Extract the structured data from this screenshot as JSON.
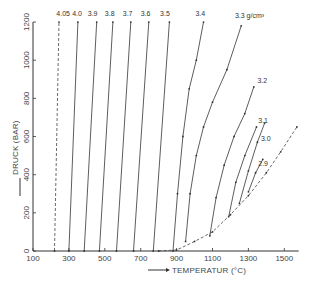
{
  "chart_data": {
    "type": "line",
    "title": "",
    "xlabel": "TEMPERATUR (°C)",
    "ylabel": "DRUCK (BAR)",
    "xlim": [
      100,
      1600
    ],
    "ylim": [
      0,
      1200
    ],
    "x_ticks": [
      100,
      300,
      500,
      700,
      900,
      1100,
      1300,
      1500
    ],
    "y_ticks": [
      0,
      200,
      400,
      600,
      800,
      1000,
      1200
    ],
    "grid": false,
    "legend": "inline labels at curve ends",
    "series": [
      {
        "name": "4.05",
        "style": "dashed",
        "points": [
          [
            220,
            0
          ],
          [
            245,
            1200
          ]
        ]
      },
      {
        "name": "4.0",
        "style": "solid",
        "points": [
          [
            300,
            0
          ],
          [
            350,
            1200
          ]
        ]
      },
      {
        "name": "3.9",
        "style": "solid",
        "points": [
          [
            385,
            0
          ],
          [
            455,
            1200
          ]
        ]
      },
      {
        "name": "3.8",
        "style": "solid",
        "points": [
          [
            470,
            0
          ],
          [
            545,
            1200
          ]
        ]
      },
      {
        "name": "3.7",
        "style": "solid",
        "points": [
          [
            565,
            0
          ],
          [
            645,
            1200
          ]
        ]
      },
      {
        "name": "3.6",
        "style": "solid",
        "points": [
          [
            660,
            0
          ],
          [
            745,
            1200
          ]
        ]
      },
      {
        "name": "3.5",
        "style": "solid",
        "points": [
          [
            770,
            0
          ],
          [
            860,
            1200
          ]
        ]
      },
      {
        "name": "3.4",
        "style": "solid",
        "points": [
          [
            880,
            0
          ],
          [
            905,
            300
          ],
          [
            935,
            600
          ],
          [
            970,
            850
          ],
          [
            1010,
            1000
          ],
          [
            1050,
            1200
          ]
        ]
      },
      {
        "name": "3.3 g/cm³",
        "style": "solid",
        "points": [
          [
            950,
            50
          ],
          [
            975,
            300
          ],
          [
            1010,
            500
          ],
          [
            1050,
            650
          ],
          [
            1100,
            780
          ],
          [
            1180,
            950
          ],
          [
            1260,
            1180
          ]
        ]
      },
      {
        "name": "3.2",
        "style": "solid",
        "points": [
          [
            1085,
            80
          ],
          [
            1120,
            280
          ],
          [
            1165,
            450
          ],
          [
            1220,
            600
          ],
          [
            1280,
            720
          ],
          [
            1330,
            860
          ]
        ]
      },
      {
        "name": "3.1",
        "style": "solid",
        "points": [
          [
            1190,
            180
          ],
          [
            1230,
            360
          ],
          [
            1280,
            500
          ],
          [
            1345,
            650
          ]
        ]
      },
      {
        "name": "3.0",
        "style": "solid",
        "points": [
          [
            1250,
            250
          ],
          [
            1300,
            420
          ],
          [
            1350,
            570
          ],
          [
            1390,
            670
          ]
        ]
      },
      {
        "name": "2.9",
        "style": "solid",
        "points": [
          [
            1300,
            310
          ],
          [
            1340,
            410
          ],
          [
            1380,
            480
          ]
        ]
      },
      {
        "name": "phase-boundary",
        "style": "dashed",
        "points": [
          [
            800,
            0
          ],
          [
            900,
            5
          ],
          [
            1000,
            50
          ],
          [
            1100,
            100
          ],
          [
            1200,
            190
          ],
          [
            1300,
            290
          ],
          [
            1400,
            410
          ],
          [
            1480,
            520
          ],
          [
            1570,
            650
          ]
        ]
      }
    ],
    "labels": [
      {
        "text": "4.05",
        "x": 230,
        "y": 1230
      },
      {
        "text": "4.0",
        "x": 318,
        "y": 1230
      },
      {
        "text": "3.9",
        "x": 405,
        "y": 1230
      },
      {
        "text": "3.8",
        "x": 500,
        "y": 1230
      },
      {
        "text": "3.7",
        "x": 600,
        "y": 1230
      },
      {
        "text": "3.6",
        "x": 700,
        "y": 1230
      },
      {
        "text": "3.5",
        "x": 808,
        "y": 1230
      },
      {
        "text": "3.4",
        "x": 1005,
        "y": 1230
      },
      {
        "text": "3.3 g/cm³",
        "x": 1225,
        "y": 1220
      },
      {
        "text": "3.2",
        "x": 1350,
        "y": 880
      },
      {
        "text": "3.1",
        "x": 1355,
        "y": 670
      },
      {
        "text": "3.0",
        "x": 1370,
        "y": 575
      },
      {
        "text": "2.9",
        "x": 1355,
        "y": 445
      }
    ],
    "annotations": [
      "arrow under y-axis label",
      "arrow before x-axis label"
    ]
  }
}
